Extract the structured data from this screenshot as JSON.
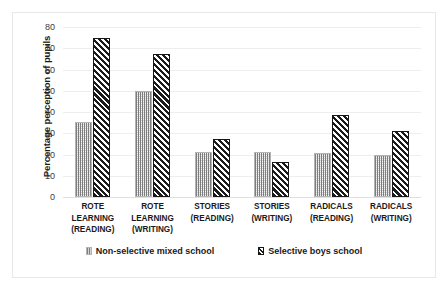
{
  "chart_data": {
    "type": "bar",
    "title": "",
    "xlabel": "",
    "ylabel": "Percentage perception of pupils",
    "ylim": [
      0,
      80
    ],
    "ytick_step": 10,
    "yticks": [
      "80",
      "70",
      "60",
      "50",
      "40",
      "30",
      "20",
      "10",
      "0"
    ],
    "grid": true,
    "legend_position": "bottom",
    "categories": [
      "ROTE LEARNING (READING)",
      "ROTE LEARNING (WRITING)",
      "STORIES (READING)",
      "STORIES (WRITING)",
      "RADICALS (READING)",
      "RADICALS (WRITING)"
    ],
    "category_lines": [
      [
        "ROTE",
        "LEARNING",
        "(READING)"
      ],
      [
        "ROTE",
        "LEARNING",
        "(WRITING)"
      ],
      [
        "STORIES",
        "(READING)"
      ],
      [
        "STORIES",
        "(WRITING)"
      ],
      [
        "RADICALS",
        "(READING)"
      ],
      [
        "RADICALS",
        "(WRITING)"
      ]
    ],
    "series": [
      {
        "name": "Non-selective mixed school",
        "pattern": "vertical-dotted",
        "color": "#d4d4d4",
        "values": [
          35.5,
          50,
          21,
          21,
          20.5,
          20
        ]
      },
      {
        "name": "Selective boys school",
        "pattern": "diagonal-hatch",
        "color": "#1b1b1b",
        "values": [
          75,
          67.5,
          27.5,
          16.5,
          38.5,
          31
        ]
      }
    ]
  },
  "legend": {
    "items": [
      {
        "label": "Non-selective mixed school"
      },
      {
        "label": "Selective boys school"
      }
    ]
  }
}
